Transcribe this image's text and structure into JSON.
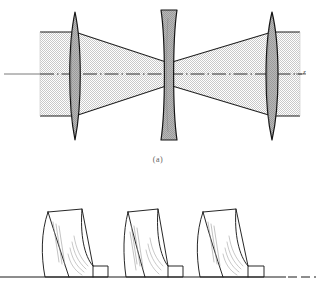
{
  "figure": {
    "panels": [
      {
        "id": "a",
        "caption": "(a)",
        "kind": "ray-diagram",
        "axis_label": "z",
        "description": "Stippled gaussian beam envelope passing through two biconvex lenses and one central biconcave lens on a dash-dot optical axis.",
        "elements": [
          {
            "name": "lens-left",
            "type": "biconvex",
            "center_x": 75,
            "label": ""
          },
          {
            "name": "lens-center",
            "type": "biconcave",
            "center_x": 169,
            "label": ""
          },
          {
            "name": "lens-right",
            "type": "biconvex",
            "center_x": 272,
            "label": ""
          }
        ]
      },
      {
        "id": "b",
        "caption": "",
        "kind": "perspective-lens-row",
        "description": "Three lens elements drawn in oblique perspective resting on a horizontal baseline.",
        "elements": [
          {
            "name": "perspective-lens-1",
            "label": ""
          },
          {
            "name": "perspective-lens-2",
            "label": ""
          },
          {
            "name": "perspective-lens-3",
            "label": ""
          }
        ]
      }
    ]
  },
  "colors": {
    "ink": "#1b1b1b",
    "lens_fill": "#9d9d9d",
    "lens_fill_light": "#b6b6b6",
    "beam_fill": "#d9d9d9",
    "axis": "#3b3b3b",
    "caption": "#5d5d5d",
    "background": "#ffffff"
  }
}
